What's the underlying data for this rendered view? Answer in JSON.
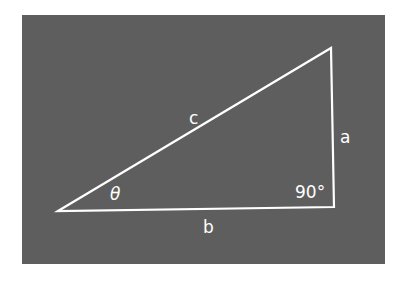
{
  "diagram": {
    "type": "right-triangle",
    "background_color": "#5e5e5e",
    "line_color": "#ffffff",
    "vertices": {
      "left": [
        58,
        211
      ],
      "top_right": [
        331,
        48
      ],
      "bottom_right": [
        334,
        207
      ]
    },
    "labels": {
      "hypotenuse": "c",
      "vertical_side": "a",
      "base": "b",
      "angle": "θ",
      "right_angle": "90°"
    }
  }
}
